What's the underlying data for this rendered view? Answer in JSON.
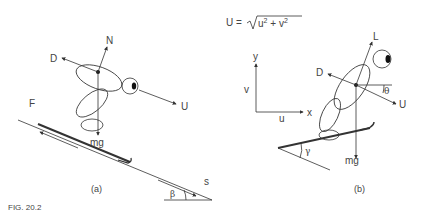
{
  "figure": {
    "caption": "FIG. 20.2",
    "panel_a": {
      "label": "(a)",
      "forces": {
        "normal": "N",
        "drag": "D",
        "velocity": "U",
        "friction": "F",
        "weight": "mg",
        "slope_dir": "s"
      },
      "angle": "β"
    },
    "panel_b": {
      "label": "(b)",
      "equation": {
        "lhs": "U =",
        "radicand_u": "u",
        "radicand_plus": " + ",
        "radicand_v": "v",
        "exp": "2"
      },
      "axes": {
        "y": "y",
        "x": "x",
        "v": "v",
        "u": "u"
      },
      "forces": {
        "lift": "L",
        "drag": "D",
        "velocity": "U",
        "weight": "mg"
      },
      "angles": {
        "theta": "θ",
        "gamma": "γ"
      }
    }
  },
  "colors": {
    "line": "#333333",
    "text": "#444444",
    "background": "#ffffff"
  }
}
